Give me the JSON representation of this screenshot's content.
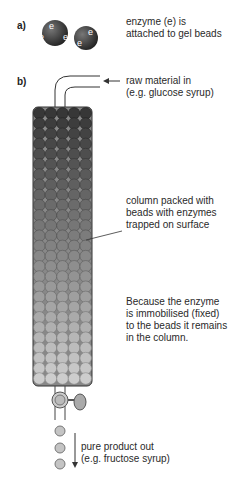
{
  "part_a": {
    "label": "a)",
    "caption_line1": "enzyme (e) is",
    "caption_line2": "attached to gel beads",
    "bead_letter": "e"
  },
  "part_b": {
    "label": "b)",
    "input": {
      "line1": "raw material in",
      "line2": "(e.g. glucose syrup)"
    },
    "column": {
      "line1": "column packed with",
      "line2": "beads with enzymes",
      "line3": "trapped on surface"
    },
    "note": {
      "line1": "Because the enzyme",
      "line2": "is immobilised (fixed)",
      "line3": "to the beads it remains",
      "line4": "in the column."
    },
    "output": {
      "line1": "pure product out",
      "line2": "(e.g. fructose syrup)"
    }
  },
  "colors": {
    "bead_top": "#3a3a3a",
    "bead_bottom": "#c8c8c8",
    "line": "#333333"
  }
}
